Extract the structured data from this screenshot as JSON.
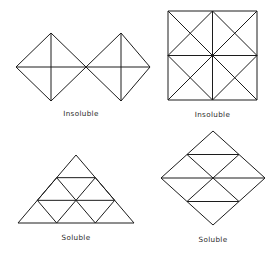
{
  "plate": {
    "background_color": "#ffffff",
    "line_color": "#1c1c1c",
    "caption_color": "#2a2a2a"
  },
  "figures": [
    {
      "id": "double-diamond",
      "name": "two-diamonds-sharing-vertex",
      "caption": "Insoluble",
      "shape_type": "two squares rotated 45 degrees joined at a vertex, each with both diagonals",
      "vertices": 9,
      "edges": 14
    },
    {
      "id": "quad-square",
      "name": "square-two-by-two-with-diagonals",
      "caption": "Insoluble",
      "shape_type": "square divided into a 2x2 grid of squares, each small square containing both diagonals",
      "vertices": 13,
      "edges": 24
    },
    {
      "id": "triangle-grid",
      "name": "triangle-subdivided-three-rows",
      "caption": "Soluble",
      "shape_type": "equilateral triangle subdivided into 9 small triangles (3 rows)",
      "vertices": 10,
      "edges": 18
    },
    {
      "id": "diamond-grid",
      "name": "diamond-subdivided-eight-triangles",
      "caption": "Soluble",
      "shape_type": "square rotated 45 degrees subdivided into 8 triangles by three horizontal chords and two diagonals",
      "vertices": 9,
      "edges": 16
    }
  ],
  "captions": {
    "insoluble": "Insoluble",
    "soluble": "Soluble"
  }
}
